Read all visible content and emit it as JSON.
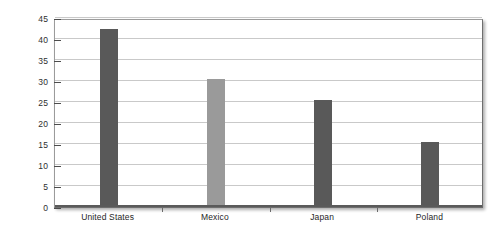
{
  "chart_data": {
    "type": "bar",
    "title": "",
    "xlabel": "",
    "ylabel": "Percentage",
    "categories": [
      "United States",
      "Mexico",
      "Japan",
      "Poland"
    ],
    "values": [
      42.5,
      30.5,
      25.5,
      15.5
    ],
    "series": [
      {
        "name": "Percentage",
        "values": [
          42.5,
          30.5,
          25.5,
          15.5
        ]
      }
    ],
    "bar_colors": [
      "#595959",
      "#9a9a9a",
      "#595959",
      "#595959"
    ],
    "ylim": [
      0,
      45
    ],
    "ytick_values": [
      0,
      5,
      10,
      15,
      20,
      25,
      30,
      35,
      40,
      45
    ],
    "ytick_labels": [
      "0",
      "5",
      "10",
      "15",
      "20",
      "25",
      "30",
      "35",
      "40",
      "45"
    ],
    "grid": true,
    "grid_axis": "y",
    "grid_color": "#c9c9c9",
    "legend": false,
    "legend_position": "none",
    "plot_background": "#ffffff",
    "frame_color": "#9b9b9b",
    "axis_color": "#5a5a5a",
    "text_color": "#2e2e2e"
  }
}
